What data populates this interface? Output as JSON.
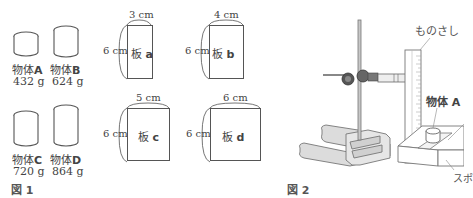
{
  "figure1": {
    "caption": "図 1",
    "objects": [
      {
        "id": "A",
        "name": "物体",
        "letter": "A",
        "mass": "432 g"
      },
      {
        "id": "B",
        "name": "物体",
        "letter": "B",
        "mass": "624 g"
      },
      {
        "id": "C",
        "name": "物体",
        "letter": "C",
        "mass": "720 g"
      },
      {
        "id": "D",
        "name": "物体",
        "letter": "D",
        "mass": "864 g"
      }
    ],
    "boards": [
      {
        "id": "a",
        "name": "板",
        "letter": "a",
        "width": "3 cm",
        "height": "6 cm"
      },
      {
        "id": "b",
        "name": "板",
        "letter": "b",
        "width": "4 cm",
        "height": "6 cm"
      },
      {
        "id": "c",
        "name": "板",
        "letter": "c",
        "width": "5 cm",
        "height": "6 cm"
      },
      {
        "id": "d",
        "name": "板",
        "letter": "d",
        "width": "6 cm",
        "height": "6 cm"
      }
    ]
  },
  "figure2": {
    "caption": "図 2",
    "labels": {
      "ruler": "ものさし",
      "object": "物体 A",
      "sponge": "スポ"
    }
  }
}
